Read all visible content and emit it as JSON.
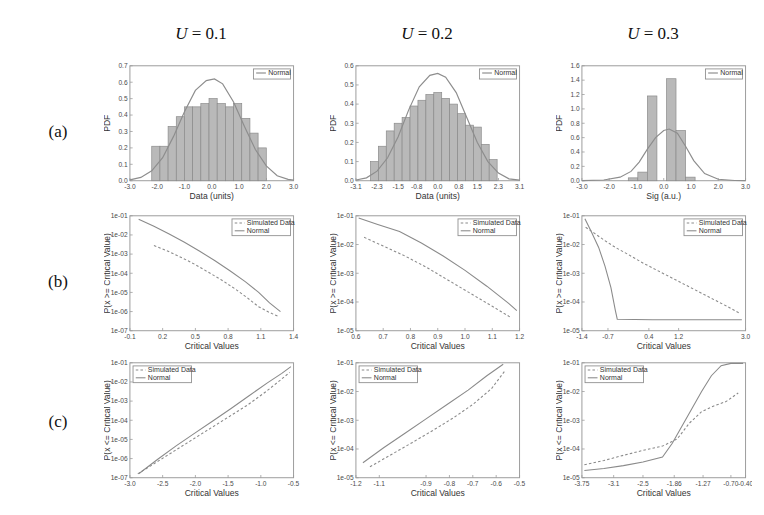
{
  "figure": {
    "column_headers": [
      {
        "var": "U",
        "op": " = ",
        "value": "0.1"
      },
      {
        "var": "U",
        "op": " = ",
        "value": "0.2"
      },
      {
        "var": "U",
        "op": " = ",
        "value": "0.3"
      }
    ],
    "row_labels": [
      "(a)",
      "(b)",
      "(c)"
    ]
  },
  "chart_data": [
    {
      "id": "a1",
      "row": "(a)",
      "column": "U = 0.1",
      "type": "bar",
      "title": "",
      "xlabel": "Data (units)",
      "ylabel": "PDF",
      "xlim": [
        -3.0,
        3.0
      ],
      "ylim": [
        0.0,
        0.7
      ],
      "xticks": [
        -3.0,
        -2.0,
        -1.0,
        0.0,
        1.0,
        2.0,
        3.0
      ],
      "xticklabels": [
        "-3.0",
        "-2.0",
        "-1.0",
        "0.0",
        "1.0",
        "2.0",
        "3.0"
      ],
      "yticks": [
        0.0,
        0.1,
        0.2,
        0.3,
        0.4,
        0.5,
        0.6,
        0.7
      ],
      "yticklabels": [
        "0.0",
        "0.1",
        "0.2",
        "0.3",
        "0.4",
        "0.5",
        "0.6",
        "0.7"
      ],
      "grid": false,
      "legend": [
        "Normal"
      ],
      "legend_position": "upper right",
      "bin_edges": [
        -2.2,
        -1.9,
        -1.6,
        -1.3,
        -1.0,
        -0.7,
        -0.4,
        -0.1,
        0.2,
        0.5,
        0.8,
        1.1,
        1.4,
        1.7,
        2.0
      ],
      "values": [
        0.21,
        0.21,
        0.33,
        0.39,
        0.45,
        0.45,
        0.47,
        0.5,
        0.47,
        0.45,
        0.47,
        0.38,
        0.29,
        0.2
      ],
      "overlay": {
        "name": "Normal",
        "type": "line",
        "x": [
          -3.0,
          -2.6,
          -2.2,
          -1.8,
          -1.4,
          -1.0,
          -0.6,
          -0.2,
          0.1,
          0.4,
          0.8,
          1.2,
          1.6,
          2.0,
          2.4,
          2.8,
          3.0
        ],
        "y": [
          0.005,
          0.02,
          0.06,
          0.14,
          0.27,
          0.42,
          0.55,
          0.61,
          0.62,
          0.59,
          0.48,
          0.33,
          0.19,
          0.09,
          0.03,
          0.008,
          0.004
        ]
      }
    },
    {
      "id": "a2",
      "row": "(a)",
      "column": "U = 0.2",
      "type": "bar",
      "title": "",
      "xlabel": "Data (units)",
      "ylabel": "PDF",
      "xlim": [
        -3.1,
        3.1
      ],
      "ylim": [
        0.0,
        0.6
      ],
      "xticks": [
        -3.1,
        -2.3,
        -1.5,
        -0.8,
        0.0,
        0.8,
        1.5,
        2.3,
        3.1
      ],
      "xticklabels": [
        "-3.1",
        "-2.3",
        "-1.5",
        "-0.8",
        "0.0",
        "0.8",
        "1.5",
        "2.3",
        "3.1"
      ],
      "yticks": [
        0.0,
        0.1,
        0.2,
        0.3,
        0.4,
        0.5,
        0.6
      ],
      "yticklabels": [
        "0.0",
        "0.1",
        "0.2",
        "0.3",
        "0.4",
        "0.5",
        "0.6"
      ],
      "grid": false,
      "legend": [
        "Normal"
      ],
      "legend_position": "upper right",
      "bin_edges": [
        -2.55,
        -2.25,
        -1.95,
        -1.65,
        -1.35,
        -1.05,
        -0.75,
        -0.45,
        -0.15,
        0.15,
        0.45,
        0.75,
        1.05,
        1.35,
        1.65,
        1.95,
        2.25
      ],
      "values": [
        0.1,
        0.18,
        0.26,
        0.3,
        0.33,
        0.39,
        0.42,
        0.45,
        0.46,
        0.43,
        0.4,
        0.35,
        0.29,
        0.28,
        0.19,
        0.11
      ],
      "overlay": {
        "name": "Normal",
        "type": "line",
        "x": [
          -3.1,
          -2.7,
          -2.3,
          -1.9,
          -1.5,
          -1.1,
          -0.7,
          -0.3,
          0.0,
          0.3,
          0.7,
          1.1,
          1.5,
          1.9,
          2.3,
          2.7,
          3.1
        ],
        "y": [
          0.004,
          0.015,
          0.05,
          0.12,
          0.23,
          0.37,
          0.49,
          0.55,
          0.56,
          0.54,
          0.46,
          0.33,
          0.2,
          0.1,
          0.04,
          0.01,
          0.003
        ]
      }
    },
    {
      "id": "a3",
      "row": "(a)",
      "column": "U = 0.3",
      "type": "bar",
      "title": "",
      "xlabel": "Sig (a.u.)",
      "ylabel": "PDF",
      "xlim": [
        -3.0,
        3.0
      ],
      "ylim": [
        0.0,
        1.6
      ],
      "xticks": [
        -3.0,
        -2.0,
        -1.0,
        0.0,
        1.0,
        2.0,
        3.0
      ],
      "xticklabels": [
        "-3.0",
        "-2.0",
        "-1.0",
        "0.0",
        "1.0",
        "2.0",
        "3.0"
      ],
      "yticks": [
        0.0,
        0.2,
        0.4,
        0.6,
        0.8,
        1.0,
        1.2,
        1.4,
        1.6
      ],
      "yticklabels": [
        "0.0",
        "0.2",
        "0.4",
        "0.6",
        "0.8",
        "1.0",
        "1.2",
        "1.4",
        "1.6"
      ],
      "grid": false,
      "legend": [
        "Normal"
      ],
      "legend_position": "upper right",
      "bin_edges": [
        -1.3,
        -0.95,
        -0.6,
        -0.25,
        0.1,
        0.45,
        0.8,
        1.15
      ],
      "values": [
        0.04,
        0.12,
        1.18,
        0.0,
        1.42,
        0.7,
        0.05
      ],
      "overlay": {
        "name": "Normal",
        "type": "line",
        "x": [
          -3.0,
          -2.2,
          -1.6,
          -1.2,
          -0.9,
          -0.6,
          -0.3,
          0.0,
          0.2,
          0.5,
          0.8,
          1.1,
          1.5,
          2.0,
          2.6,
          3.0
        ],
        "y": [
          0.002,
          0.01,
          0.05,
          0.13,
          0.26,
          0.44,
          0.6,
          0.7,
          0.72,
          0.66,
          0.48,
          0.28,
          0.1,
          0.02,
          0.003,
          0.001
        ]
      }
    },
    {
      "id": "b1",
      "row": "(b)",
      "column": "U = 0.1",
      "type": "line",
      "title": "",
      "xlabel": "Critical Values",
      "ylabel": "P(x >= Critical Value)",
      "xlim": [
        -0.1,
        1.4
      ],
      "ylim": [
        -7.0,
        -1.0
      ],
      "xticks": [
        -0.1,
        0.2,
        0.5,
        0.8,
        1.1,
        1.4
      ],
      "xticklabels": [
        "-0.1",
        "0.2",
        "0.5",
        "0.8",
        "1.1",
        "1.4"
      ],
      "yticks": [
        -7.0,
        -6.0,
        -5.0,
        -4.0,
        -3.0,
        -2.0,
        -1.0
      ],
      "yticklabels": [
        "1e-07",
        "1e-06",
        "1e-05",
        "1e-04",
        "1e-03",
        "1e-02",
        "1e-01"
      ],
      "grid": false,
      "legend": [
        "Simulated Data",
        "Normal"
      ],
      "legend_position": "upper right",
      "series": [
        {
          "name": "Simulated Data",
          "style": "dashed",
          "x": [
            0.12,
            0.25,
            0.38,
            0.5,
            0.62,
            0.74,
            0.86,
            0.98,
            1.08,
            1.18,
            1.26
          ],
          "y": [
            -2.55,
            -2.85,
            -3.2,
            -3.55,
            -3.95,
            -4.35,
            -4.8,
            -5.3,
            -5.75,
            -6.05,
            -6.25
          ]
        },
        {
          "name": "Normal",
          "style": "solid",
          "x": [
            -0.02,
            0.12,
            0.26,
            0.4,
            0.54,
            0.68,
            0.82,
            0.96,
            1.08,
            1.18,
            1.28
          ],
          "y": [
            -1.18,
            -1.55,
            -1.95,
            -2.38,
            -2.85,
            -3.35,
            -3.88,
            -4.45,
            -5.0,
            -5.55,
            -6.0
          ]
        }
      ]
    },
    {
      "id": "b2",
      "row": "(b)",
      "column": "U = 0.2",
      "type": "line",
      "title": "",
      "xlabel": "Critical Values",
      "ylabel": "P(x >= Critical Value)",
      "xlim": [
        0.6,
        1.2
      ],
      "ylim": [
        -5.0,
        -1.0
      ],
      "xticks": [
        0.6,
        0.7,
        0.8,
        0.9,
        1.0,
        1.1,
        1.2
      ],
      "xticklabels": [
        "0.6",
        "0.7",
        "0.8",
        "0.9",
        "1.0",
        "1.1",
        "1.2"
      ],
      "yticks": [
        -5.0,
        -4.0,
        -3.0,
        -2.0,
        -1.0
      ],
      "yticklabels": [
        "1e-05",
        "1e-04",
        "1e-03",
        "1e-02",
        "1e-01"
      ],
      "grid": false,
      "legend": [
        "Simulated Data",
        "Normal"
      ],
      "legend_position": "upper right",
      "series": [
        {
          "name": "Simulated Data",
          "style": "dashed",
          "x": [
            0.63,
            0.7,
            0.78,
            0.86,
            0.94,
            1.02,
            1.1,
            1.17
          ],
          "y": [
            -1.75,
            -2.05,
            -2.4,
            -2.8,
            -3.25,
            -3.7,
            -4.15,
            -4.55
          ]
        },
        {
          "name": "Normal",
          "style": "solid",
          "x": [
            0.61,
            0.68,
            0.76,
            0.84,
            0.92,
            1.0,
            1.08,
            1.16,
            1.19
          ],
          "y": [
            -1.08,
            -1.3,
            -1.55,
            -1.95,
            -2.4,
            -2.9,
            -3.45,
            -4.05,
            -4.3
          ]
        }
      ]
    },
    {
      "id": "b3",
      "row": "(b)",
      "column": "U = 0.3",
      "type": "line",
      "title": "",
      "xlabel": "Critical Values",
      "ylabel": "P(x >= Critical Value)",
      "xlim": [
        -1.4,
        3.0
      ],
      "ylim": [
        -5.0,
        -1.0
      ],
      "xticks": [
        -1.4,
        -0.7,
        0.4,
        1.2,
        3.0
      ],
      "xticklabels": [
        "-1.4",
        "-0.7",
        "0.4",
        "1.2",
        "3.0"
      ],
      "yticks": [
        -5.0,
        -4.0,
        -3.0,
        -2.0,
        -1.0
      ],
      "yticklabels": [
        "1e-05",
        "1e-04",
        "1e-03",
        "1e-02",
        "1e-01"
      ],
      "grid": false,
      "legend": [
        "Simulated Data",
        "Normal"
      ],
      "legend_position": "upper right",
      "series": [
        {
          "name": "Simulated Data",
          "style": "dashed",
          "x": [
            -1.3,
            -1.05,
            -0.8,
            -0.5,
            -0.15,
            0.25,
            0.7,
            1.15,
            1.6,
            2.05,
            2.5,
            2.85
          ],
          "y": [
            -1.4,
            -1.62,
            -1.85,
            -2.1,
            -2.35,
            -2.65,
            -2.95,
            -3.25,
            -3.55,
            -3.85,
            -4.15,
            -4.4
          ]
        },
        {
          "name": "Normal",
          "style": "solid",
          "x": [
            -1.32,
            -1.15,
            -0.95,
            -0.78,
            -0.62,
            -0.5,
            -0.45,
            0.5,
            1.5,
            2.5,
            2.9
          ],
          "y": [
            -1.1,
            -1.55,
            -2.1,
            -2.75,
            -3.5,
            -4.3,
            -4.6,
            -4.62,
            -4.62,
            -4.62,
            -4.62
          ]
        }
      ]
    },
    {
      "id": "c1",
      "row": "(c)",
      "column": "U = 0.1",
      "type": "line",
      "title": "",
      "xlabel": "Critical Values",
      "ylabel": "P(x <= Critical Value)",
      "xlim": [
        -3.0,
        -0.5
      ],
      "ylim": [
        -7.0,
        -1.0
      ],
      "xticks": [
        -3.0,
        -2.5,
        -2.0,
        -1.5,
        -1.0,
        -0.5
      ],
      "xticklabels": [
        "-3.0",
        "-2.5",
        "-2.0",
        "-1.5",
        "-1.0",
        "-0.5"
      ],
      "yticks": [
        -7.0,
        -6.0,
        -5.0,
        -4.0,
        -3.0,
        -2.0,
        -1.0
      ],
      "yticklabels": [
        "1e-07",
        "1e-06",
        "1e-05",
        "1e-04",
        "1e-03",
        "1e-02",
        "1e-01"
      ],
      "grid": false,
      "legend": [
        "Simulated Data",
        "Normal"
      ],
      "legend_position": "upper left",
      "series": [
        {
          "name": "Simulated Data",
          "style": "dashed",
          "x": [
            -2.88,
            -2.6,
            -2.32,
            -2.04,
            -1.76,
            -1.48,
            -1.2,
            -0.92,
            -0.7,
            -0.56
          ],
          "y": [
            -6.8,
            -6.2,
            -5.6,
            -5.0,
            -4.4,
            -3.8,
            -3.2,
            -2.5,
            -1.9,
            -1.5
          ]
        },
        {
          "name": "Normal",
          "style": "solid",
          "x": [
            -2.86,
            -2.58,
            -2.3,
            -2.02,
            -1.74,
            -1.46,
            -1.18,
            -0.9,
            -0.68,
            -0.54
          ],
          "y": [
            -6.78,
            -6.05,
            -5.35,
            -4.7,
            -4.05,
            -3.4,
            -2.72,
            -2.05,
            -1.55,
            -1.2
          ]
        }
      ]
    },
    {
      "id": "c2",
      "row": "(c)",
      "column": "U = 0.2",
      "type": "line",
      "title": "",
      "xlabel": "Critical Values",
      "ylabel": "P(x <= Critical Value)",
      "xlim": [
        -1.2,
        -0.5
      ],
      "ylim": [
        -5.0,
        -1.0
      ],
      "xticks": [
        -1.2,
        -1.1,
        -0.9,
        -0.8,
        -0.7,
        -0.6,
        -0.5
      ],
      "xticklabels": [
        "-1.2",
        "-1.1",
        "-0.9",
        "-0.8",
        "-0.7",
        "-0.6",
        "-0.5"
      ],
      "yticks": [
        -5.0,
        -4.0,
        -3.0,
        -2.0,
        -1.0
      ],
      "yticklabels": [
        "1e-05",
        "1e-04",
        "1e-03",
        "1e-02",
        "1e-01"
      ],
      "grid": false,
      "legend": [
        "Simulated Data",
        "Normal"
      ],
      "legend_position": "upper left",
      "series": [
        {
          "name": "Simulated Data",
          "style": "dashed",
          "x": [
            -1.14,
            -1.05,
            -0.96,
            -0.87,
            -0.78,
            -0.7,
            -0.62,
            -0.56
          ],
          "y": [
            -4.62,
            -4.2,
            -3.78,
            -3.35,
            -2.9,
            -2.45,
            -1.9,
            -1.25
          ]
        },
        {
          "name": "Normal",
          "style": "solid",
          "x": [
            -1.17,
            -1.08,
            -0.99,
            -0.9,
            -0.81,
            -0.72,
            -0.64,
            -0.57
          ],
          "y": [
            -4.48,
            -3.95,
            -3.45,
            -2.95,
            -2.45,
            -1.95,
            -1.45,
            -1.05
          ]
        }
      ]
    },
    {
      "id": "c3",
      "row": "(c)",
      "column": "U = 0.3",
      "type": "line",
      "title": "",
      "xlabel": "Critical Values",
      "ylabel": "P(x <= Critical Value)",
      "xlim": [
        -3.75,
        -0.4
      ],
      "ylim": [
        -5.0,
        -1.0
      ],
      "xticks": [
        -3.75,
        -3.1,
        -2.5,
        -1.86,
        -1.27,
        -0.7,
        -0.4
      ],
      "xticklabels": [
        "-3.75",
        "-3.1",
        "-2.5",
        "-1.86",
        "-1.27",
        "-0.70",
        "-0.40"
      ],
      "yticks": [
        -5.0,
        -4.0,
        -3.0,
        -2.0,
        -1.0
      ],
      "yticklabels": [
        "1e-05",
        "1e-04",
        "1e-03",
        "1e-02",
        "1e-01"
      ],
      "grid": false,
      "legend": [
        "Simulated Data",
        "Normal"
      ],
      "legend_position": "upper left",
      "series": [
        {
          "name": "Simulated Data",
          "style": "dashed",
          "x": [
            -3.7,
            -3.3,
            -2.9,
            -2.5,
            -2.1,
            -1.8,
            -1.55,
            -1.3,
            -1.05,
            -0.8,
            -0.55
          ],
          "y": [
            -4.55,
            -4.4,
            -4.22,
            -4.05,
            -3.9,
            -3.65,
            -3.1,
            -2.7,
            -2.5,
            -2.35,
            -2.05
          ]
        },
        {
          "name": "Normal",
          "style": "solid",
          "x": [
            -3.7,
            -3.3,
            -2.9,
            -2.5,
            -2.1,
            -1.9,
            -1.7,
            -1.5,
            -1.3,
            -1.1,
            -0.9,
            -0.7,
            -0.45
          ],
          "y": [
            -4.75,
            -4.68,
            -4.58,
            -4.45,
            -4.28,
            -3.8,
            -3.2,
            -2.6,
            -2.0,
            -1.45,
            -1.1,
            -1.02,
            -1.02
          ]
        }
      ]
    }
  ]
}
